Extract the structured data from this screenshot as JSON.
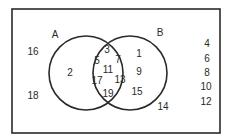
{
  "diagram": {
    "type": "venn",
    "universe_box": {
      "x": 12,
      "y": 9,
      "w": 208,
      "h": 124
    },
    "stroke_color": "#2a2a2a",
    "sets": [
      {
        "name": "A",
        "cx": 86,
        "cy": 73,
        "r": 37,
        "label_pos": [
          55,
          35
        ]
      },
      {
        "name": "B",
        "cx": 130,
        "cy": 73,
        "r": 37,
        "label_pos": [
          160,
          33
        ]
      }
    ],
    "regions": {
      "outside": [
        {
          "value": "16",
          "pos": [
            33,
            52
          ]
        },
        {
          "value": "18",
          "pos": [
            33,
            96
          ]
        },
        {
          "value": "14",
          "pos": [
            163,
            107
          ]
        },
        {
          "value": "4",
          "pos": [
            207,
            44
          ]
        },
        {
          "value": "6",
          "pos": [
            207,
            59
          ]
        },
        {
          "value": "8",
          "pos": [
            207,
            73
          ]
        },
        {
          "value": "10",
          "pos": [
            206,
            87
          ]
        },
        {
          "value": "12",
          "pos": [
            206,
            102
          ]
        }
      ],
      "a_only": [
        {
          "value": "2",
          "pos": [
            70,
            73
          ]
        }
      ],
      "a_and_b": [
        {
          "value": "3",
          "pos": [
            107,
            50
          ]
        },
        {
          "value": "5",
          "pos": [
            97,
            61
          ]
        },
        {
          "value": "7",
          "pos": [
            118,
            60
          ]
        },
        {
          "value": "11",
          "pos": [
            108,
            70
          ]
        },
        {
          "value": "17",
          "pos": [
            97,
            81
          ]
        },
        {
          "value": "13",
          "pos": [
            120,
            80
          ]
        },
        {
          "value": "19",
          "pos": [
            108,
            94
          ]
        }
      ],
      "b_only": [
        {
          "value": "1",
          "pos": [
            139,
            54
          ]
        },
        {
          "value": "9",
          "pos": [
            139,
            72
          ]
        },
        {
          "value": "15",
          "pos": [
            137,
            92
          ]
        }
      ]
    }
  }
}
